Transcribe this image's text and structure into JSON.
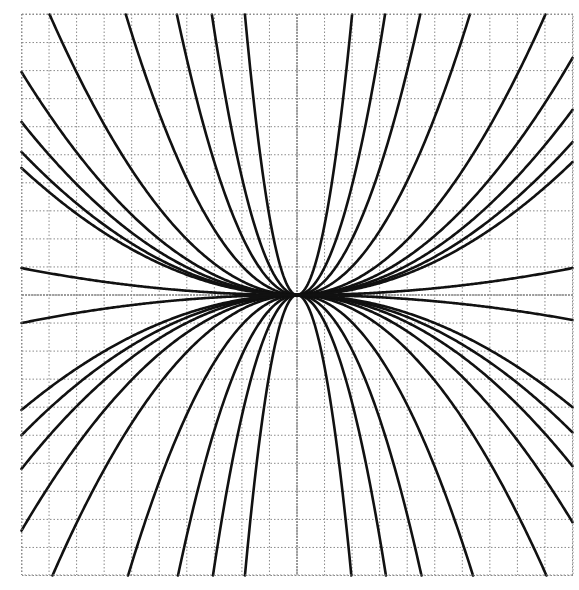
{
  "chart_data": {
    "type": "line",
    "title": "",
    "xlabel": "",
    "ylabel": "",
    "xlim": [
      -10,
      10
    ],
    "ylim": [
      -10,
      10
    ],
    "grid": true,
    "grid_step": 1,
    "series": [
      {
        "name": "upper-left-1",
        "quadrant": "left",
        "C": 0.124
      },
      {
        "name": "upper-left-2",
        "quadrant": "left",
        "C": 0.259
      },
      {
        "name": "upper-left-3",
        "quadrant": "left",
        "C": 0.526
      },
      {
        "name": "upper-left-4",
        "quadrant": "left",
        "C": 1.047
      },
      {
        "name": "upper-left-5",
        "quadrant": "left",
        "C": 2.8
      },
      {
        "name": "upper-left-6",
        "quadrant": "left",
        "C": 0.0795
      },
      {
        "name": "upper-left-7",
        "quadrant": "left",
        "C": 0.0617
      },
      {
        "name": "upper-left-8",
        "quadrant": "left",
        "C": 0.051
      },
      {
        "name": "upper-left-9",
        "quadrant": "left",
        "C": 0.0453
      },
      {
        "name": "upper-left-10",
        "quadrant": "left",
        "C": 0.0096
      },
      {
        "name": "upper-right-1",
        "quadrant": "right",
        "C": 2.5
      },
      {
        "name": "upper-right-2",
        "quadrant": "right",
        "C": 0.98
      },
      {
        "name": "upper-right-3",
        "quadrant": "right",
        "C": 0.5
      },
      {
        "name": "upper-right-4",
        "quadrant": "right",
        "C": 0.254
      },
      {
        "name": "upper-right-5",
        "quadrant": "right",
        "C": 0.123
      },
      {
        "name": "upper-right-6",
        "quadrant": "right",
        "C": 0.0845
      },
      {
        "name": "upper-right-7",
        "quadrant": "right",
        "C": 0.066
      },
      {
        "name": "upper-right-8",
        "quadrant": "right",
        "C": 0.0545
      },
      {
        "name": "upper-right-9",
        "quadrant": "right",
        "C": 0.0474
      },
      {
        "name": "upper-right-10",
        "quadrant": "right",
        "C": 0.0096
      },
      {
        "name": "lower-left-1",
        "quadrant": "left",
        "C": -0.127
      },
      {
        "name": "lower-left-2",
        "quadrant": "left",
        "C": -0.266
      },
      {
        "name": "lower-left-3",
        "quadrant": "left",
        "C": -0.536
      },
      {
        "name": "lower-left-4",
        "quadrant": "left",
        "C": -1.075
      },
      {
        "name": "lower-left-5",
        "quadrant": "left",
        "C": -2.8
      },
      {
        "name": "lower-left-6",
        "quadrant": "left",
        "C": -0.084
      },
      {
        "name": "lower-left-7",
        "quadrant": "left",
        "C": -0.062
      },
      {
        "name": "lower-left-8",
        "quadrant": "left",
        "C": -0.05
      },
      {
        "name": "lower-left-9",
        "quadrant": "left",
        "C": -0.041
      },
      {
        "name": "lower-left-10",
        "quadrant": "left",
        "C": -0.01
      },
      {
        "name": "lower-right-1",
        "quadrant": "right",
        "C": -2.57
      },
      {
        "name": "lower-right-2",
        "quadrant": "right",
        "C": -0.96
      },
      {
        "name": "lower-right-3",
        "quadrant": "right",
        "C": -0.49
      },
      {
        "name": "lower-right-4",
        "quadrant": "right",
        "C": -0.245
      },
      {
        "name": "lower-right-5",
        "quadrant": "right",
        "C": -0.122
      },
      {
        "name": "lower-right-6",
        "quadrant": "right",
        "C": -0.081
      },
      {
        "name": "lower-right-7",
        "quadrant": "right",
        "C": -0.061
      },
      {
        "name": "lower-right-8",
        "quadrant": "right",
        "C": -0.049
      },
      {
        "name": "lower-right-9",
        "quadrant": "right",
        "C": -0.04
      },
      {
        "name": "lower-right-10",
        "quadrant": "right",
        "C": -0.0089
      }
    ]
  },
  "layout": {
    "plot_left": 22,
    "plot_top": 14,
    "plot_right": 573,
    "plot_bottom": 575,
    "origin_x": 297,
    "origin_y": 295
  },
  "colors": {
    "background": "#ffffff",
    "grid": "#8a8a8a",
    "axis": "#8a8a8a",
    "curve": "#111111"
  }
}
